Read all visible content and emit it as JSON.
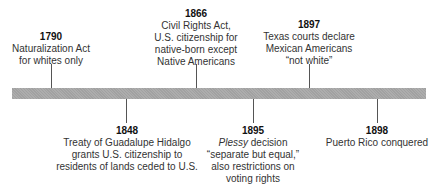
{
  "timeline": {
    "bar_color": "#a8a8a8",
    "events_above": [
      {
        "year": "1790",
        "lines": [
          "Naturalization Act",
          "for whites only"
        ]
      },
      {
        "year": "1866",
        "lines": [
          "Civil Rights Act,",
          "U.S. citizenship for",
          "native-born except",
          "Native Americans"
        ]
      },
      {
        "year": "1897",
        "lines": [
          "Texas courts declare",
          "Mexican Americans",
          "“not white”"
        ]
      }
    ],
    "events_below": [
      {
        "year": "1848",
        "lines": [
          "Treaty of Guadalupe Hidalgo",
          "grants U.S. citizenship to",
          "residents of lands ceded to U.S."
        ]
      },
      {
        "year": "1895",
        "italic_word": "Plessy",
        "first_line_rest": " decision",
        "lines": [
          "“separate but equal,”",
          "also restrictions on",
          "voting rights"
        ]
      },
      {
        "year": "1898",
        "lines": [
          "Puerto Rico conquered"
        ]
      }
    ]
  }
}
